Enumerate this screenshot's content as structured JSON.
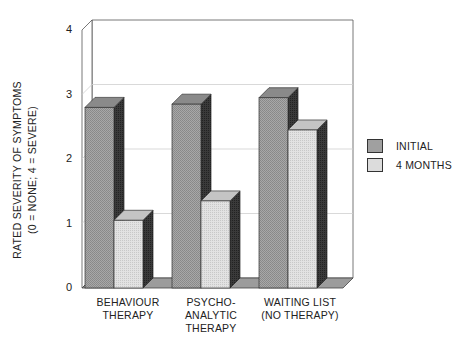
{
  "chart_data": {
    "type": "bar",
    "style": "3d-clustered",
    "title": "",
    "xlabel": "",
    "ylabel": "RATED SEVERITY OF SYMPTOMS (0 = NONE; 4 = SEVERE)",
    "ylabel_lines": [
      "RATED  SEVERITY  OF  SYMPTOMS",
      "(0 = NONE;  4 = SEVERE)"
    ],
    "ylim": [
      0,
      4
    ],
    "yticks": [
      "0",
      "1",
      "2",
      "3",
      "4"
    ],
    "grid": true,
    "legend_position": "right",
    "categories": [
      "BEHAVIOUR THERAPY",
      "PSYCHO-ANALYTIC THERAPY",
      "WAITING LIST (NO THERAPY)"
    ],
    "category_label_lines": [
      [
        "BEHAVIOUR",
        "THERAPY"
      ],
      [
        "PSYCHO-",
        "ANALYTIC",
        "THERAPY"
      ],
      [
        "WAITING LIST",
        "(NO THERAPY)"
      ]
    ],
    "series": [
      {
        "name": "INITIAL",
        "values": [
          2.8,
          2.85,
          2.95
        ],
        "color": "#9a9a9a"
      },
      {
        "name": "4 MONTHS",
        "values": [
          1.05,
          1.35,
          2.45
        ],
        "color": "#d6d6d6"
      }
    ]
  }
}
